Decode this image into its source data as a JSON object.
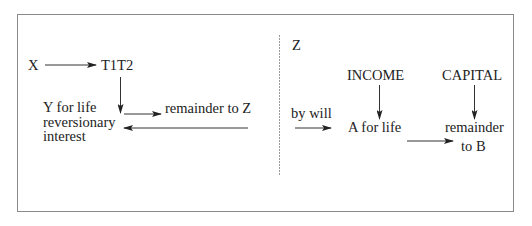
{
  "diagram": {
    "left_panel": {
      "settlor": "X",
      "trustees": "T1T2",
      "life_tenant": [
        "Y for life",
        "reversionary",
        "interest"
      ],
      "remainder": "remainder to Z"
    },
    "right_panel": {
      "heading": "Z",
      "transfer": "by will",
      "income_label": "INCOME",
      "capital_label": "CAPITAL",
      "life_tenant": "A for life",
      "remainder": [
        "remainder",
        "to B"
      ]
    },
    "colors": {
      "text": "#222222",
      "line": "#333333",
      "frame": "#8a8a8a",
      "divider": "#9a9a9a"
    }
  }
}
